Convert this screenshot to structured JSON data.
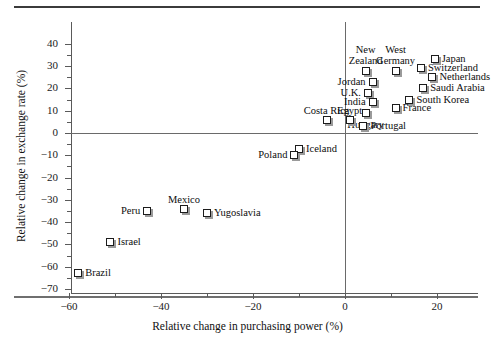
{
  "chart_data": {
    "type": "scatter",
    "title": "",
    "xlabel": "Relative change in purchasing power (%)",
    "ylabel": "Relative change in exchange rate (%)",
    "xlim": [
      -62,
      26
    ],
    "ylim": [
      -70,
      45
    ],
    "xticks": [
      -60,
      -40,
      -20,
      0,
      20
    ],
    "xticklabels": [
      "−60",
      "−40",
      "−20",
      "0",
      "20"
    ],
    "yticks": [
      -70,
      -60,
      -50,
      -40,
      -30,
      -20,
      -10,
      0,
      10,
      20,
      30,
      40
    ],
    "yticklabels": [
      "−70",
      "−60",
      "−50",
      "−40",
      "−30",
      "−20",
      "−10",
      "0",
      "10",
      "20",
      "30",
      "40"
    ],
    "grid": false,
    "legend": "none",
    "reference_lines": [
      {
        "axis": "y",
        "value": 0
      },
      {
        "axis": "x",
        "value": 0
      }
    ],
    "points": [
      {
        "name": "Japan",
        "x": 19.5,
        "y": 33,
        "label_pos": "right"
      },
      {
        "name": "Switzerland",
        "x": 16.5,
        "y": 29,
        "label_pos": "right"
      },
      {
        "name": "Netherlands",
        "x": 19,
        "y": 25,
        "label_pos": "right"
      },
      {
        "name": "Saudi Arabia",
        "x": 17,
        "y": 20,
        "label_pos": "right"
      },
      {
        "name": "South Korea",
        "x": 14,
        "y": 15,
        "label_pos": "right"
      },
      {
        "name": "France",
        "x": 11,
        "y": 11,
        "label_pos": "right"
      },
      {
        "name": "West Germany",
        "x": 11,
        "y": 28,
        "label_pos": "above-center"
      },
      {
        "name": "New Zealand",
        "x": 4.5,
        "y": 28,
        "label_pos": "above-center"
      },
      {
        "name": "Jordan",
        "x": 6,
        "y": 23,
        "label_pos": "left"
      },
      {
        "name": "U.K.",
        "x": 5,
        "y": 18,
        "label_pos": "left"
      },
      {
        "name": "India",
        "x": 6,
        "y": 14,
        "label_pos": "left"
      },
      {
        "name": "Hungary",
        "x": 4.5,
        "y": 9,
        "label_pos": "below-center"
      },
      {
        "name": "Egypt",
        "x": 1,
        "y": 6,
        "label_pos": "above-center"
      },
      {
        "name": "Portugal",
        "x": 4,
        "y": 3,
        "label_pos": "right"
      },
      {
        "name": "Costa Rica",
        "x": -4,
        "y": 6,
        "label_pos": "above-center"
      },
      {
        "name": "Iceland",
        "x": -10,
        "y": -7,
        "label_pos": "right"
      },
      {
        "name": "Poland",
        "x": -11,
        "y": -10,
        "label_pos": "left"
      },
      {
        "name": "Mexico",
        "x": -35,
        "y": -34,
        "label_pos": "above-center"
      },
      {
        "name": "Yugoslavia",
        "x": -30,
        "y": -36,
        "label_pos": "right"
      },
      {
        "name": "Peru",
        "x": -43,
        "y": -35,
        "label_pos": "left"
      },
      {
        "name": "Israel",
        "x": -51,
        "y": -49,
        "label_pos": "right"
      },
      {
        "name": "Brazil",
        "x": -58,
        "y": -63,
        "label_pos": "right"
      }
    ]
  },
  "colors": {
    "marker_fill": "#ffffff",
    "marker_edge": "#1c1c1c",
    "marker_shadow": "#9a9a9a",
    "axis": "#5a5a5a",
    "text": "#0d0d0d",
    "rule": "#3b3b3b"
  }
}
